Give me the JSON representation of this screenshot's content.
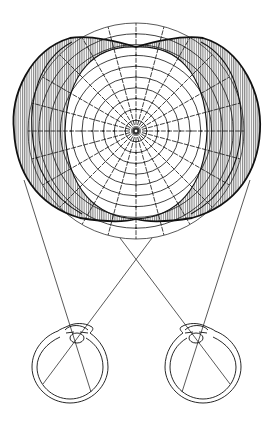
{
  "figure": {
    "title": "Binocular visual field diagram"
  },
  "colors": {
    "ink": "#111111",
    "hatch": "#222222",
    "background": "#ffffff"
  },
  "field": {
    "center": [
      136,
      131
    ],
    "perimeter_rings": 10,
    "ring_step": 10.8,
    "meridians": 24,
    "binocular_region": "central unshaded area",
    "monocular_regions": [
      "left temporal crescent",
      "right temporal crescent"
    ]
  },
  "eyes": [
    {
      "name": "left eye",
      "center": [
        70,
        365
      ],
      "radius": 38
    },
    {
      "name": "right eye",
      "center": [
        207,
        365
      ],
      "radius": 38
    }
  ],
  "sight_lines_crossing": [
    136,
    258
  ]
}
